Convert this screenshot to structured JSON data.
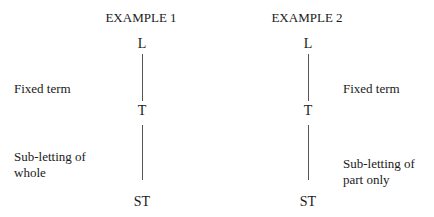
{
  "examples": [
    {
      "title": "EXAMPLE 1",
      "nodes": {
        "landlord": "L",
        "tenant": "T",
        "subtenant": "ST"
      },
      "relations": {
        "first": "Fixed term",
        "second_line1": "Sub-letting of",
        "second_line2": "whole"
      }
    },
    {
      "title": "EXAMPLE 2",
      "nodes": {
        "landlord": "L",
        "tenant": "T",
        "subtenant": "ST"
      },
      "relations": {
        "first": "Fixed term",
        "second_line1": "Sub-letting of",
        "second_line2": "part only"
      }
    }
  ]
}
